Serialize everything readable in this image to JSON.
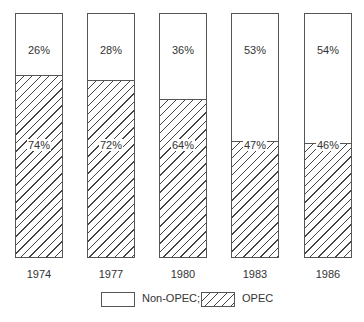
{
  "chart_data": {
    "type": "bar",
    "stacked": true,
    "percent": true,
    "categories": [
      "1974",
      "1977",
      "1980",
      "1983",
      "1986"
    ],
    "series": [
      {
        "name": "OPEC",
        "values": [
          74,
          72,
          64,
          47,
          46
        ],
        "pattern": "hatched"
      },
      {
        "name": "Non-OPEC",
        "values": [
          26,
          28,
          36,
          53,
          54
        ],
        "pattern": "solid-white"
      }
    ],
    "labels": {
      "non_opec": [
        "26%",
        "28%",
        "36%",
        "53%",
        "54%"
      ],
      "opec": [
        "74%",
        "72%",
        "64%",
        "47%",
        "46%"
      ]
    },
    "title": "",
    "xlabel": "",
    "ylabel": "",
    "ylim": [
      0,
      100
    ],
    "grid": false,
    "legend": {
      "position": "bottom",
      "entries": [
        "Non-OPEC;",
        "OPEC"
      ]
    }
  }
}
